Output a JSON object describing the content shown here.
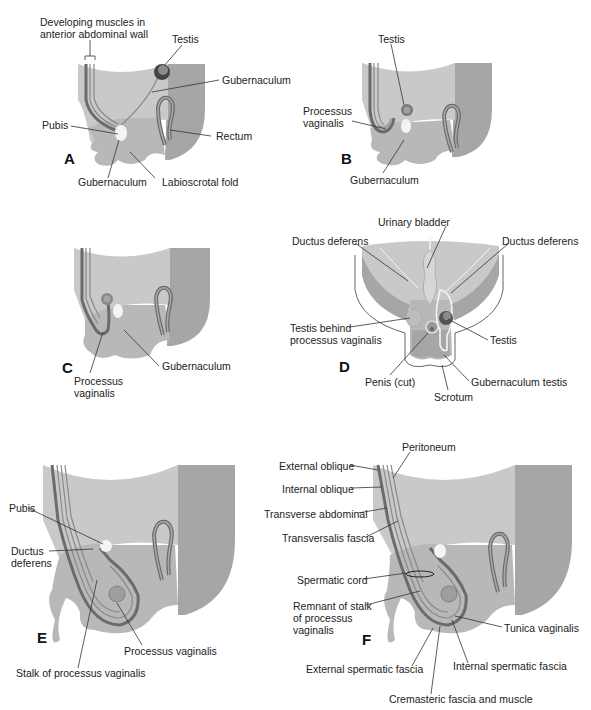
{
  "figure": {
    "colors": {
      "tissue_light": "#c9c9c9",
      "tissue_mid": "#b4b4b4",
      "tissue_dark": "#9d9d9d",
      "wall_layer": "#6e6e6e",
      "outline": "#555555",
      "pubis": "#f4f4f4",
      "background": "#ffffff"
    },
    "panels": [
      {
        "letter": "A",
        "labels": [
          "Developing muscles in\nanterior abdominal wall",
          "Testis",
          "Gubernaculum",
          "Pubis",
          "Rectum",
          "Gubernaculum",
          "Labioscrotal fold"
        ]
      },
      {
        "letter": "B",
        "labels": [
          "Testis",
          "Processus\nvaginalis",
          "Gubernaculum"
        ]
      },
      {
        "letter": "C",
        "labels": [
          "Gubernaculum",
          "Processus\nvaginalis"
        ]
      },
      {
        "letter": "D",
        "labels": [
          "Urinary bladder",
          "Ductus deferens",
          "Ductus deferens",
          "Testis behind\nprocessus vaginalis",
          "Testis",
          "Penis (cut)",
          "Gubernaculum testis",
          "Scrotum"
        ]
      },
      {
        "letter": "E",
        "labels": [
          "Pubis",
          "Ductus\ndeferens",
          "Processus vaginalis",
          "Stalk of processus vaginalis"
        ]
      },
      {
        "letter": "F",
        "labels": [
          "Peritoneum",
          "External oblique",
          "Internal oblique",
          "Transverse abdominal",
          "Transversalis fascia",
          "Spermatic cord",
          "Remnant of stalk\nof processus\nvaginalis",
          "Tunica vaginalis",
          "External spermatic fascia",
          "Internal spermatic fascia",
          "Cremasteric fascia and muscle"
        ]
      }
    ]
  }
}
